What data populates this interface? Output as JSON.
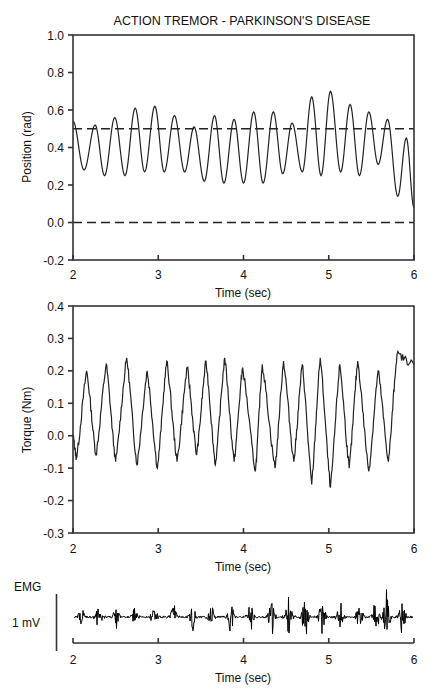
{
  "title": "ACTION TREMOR - PARKINSON'S DISEASE",
  "colors": {
    "trace": "#222222",
    "axis": "#333333",
    "background": "#ffffff"
  },
  "chart_data": [
    {
      "type": "line",
      "panel": "position",
      "title": "ACTION TREMOR - PARKINSON'S DISEASE",
      "xlabel": "Time (sec)",
      "ylabel": "Position (rad)",
      "xlim": [
        2,
        6
      ],
      "ylim": [
        -0.2,
        1.0
      ],
      "xticks": [
        "2",
        "3",
        "4",
        "5",
        "6"
      ],
      "yticks": [
        "-0.2",
        "0.0",
        "0.2",
        "0.4",
        "0.6",
        "0.8",
        "1.0"
      ],
      "grid": false,
      "reference_lines": [
        {
          "y": 0.5,
          "style": "dashed"
        },
        {
          "y": 0.0,
          "style": "dashed"
        }
      ],
      "series": [
        {
          "name": "Position",
          "extrema_t": [
            2.0,
            2.13,
            2.26,
            2.37,
            2.49,
            2.61,
            2.73,
            2.84,
            2.96,
            3.07,
            3.19,
            3.31,
            3.42,
            3.54,
            3.66,
            3.77,
            3.89,
            4.0,
            4.12,
            4.23,
            4.35,
            4.46,
            4.57,
            4.69,
            4.8,
            4.91,
            5.02,
            5.14,
            5.25,
            5.36,
            5.47,
            5.58,
            5.69,
            5.81,
            5.91,
            6.0
          ],
          "extrema_v": [
            0.54,
            0.28,
            0.52,
            0.25,
            0.56,
            0.25,
            0.61,
            0.27,
            0.62,
            0.27,
            0.57,
            0.27,
            0.51,
            0.22,
            0.57,
            0.21,
            0.55,
            0.21,
            0.59,
            0.21,
            0.59,
            0.26,
            0.53,
            0.27,
            0.67,
            0.25,
            0.7,
            0.27,
            0.63,
            0.25,
            0.59,
            0.31,
            0.55,
            0.14,
            0.45,
            0.08
          ]
        }
      ]
    },
    {
      "type": "line",
      "panel": "torque",
      "xlabel": "Time (sec)",
      "ylabel": "Torque (Nm)",
      "xlim": [
        2,
        6
      ],
      "ylim": [
        -0.3,
        0.4
      ],
      "xticks": [
        "2",
        "3",
        "4",
        "5",
        "6"
      ],
      "yticks": [
        "-0.3",
        "-0.2",
        "-0.1",
        "0.0",
        "0.1",
        "0.2",
        "0.3",
        "0.4"
      ],
      "grid": false,
      "series": [
        {
          "name": "Torque",
          "extrema_t": [
            2.0,
            2.04,
            2.16,
            2.27,
            2.39,
            2.5,
            2.63,
            2.75,
            2.87,
            2.99,
            3.1,
            3.22,
            3.34,
            3.45,
            3.56,
            3.67,
            3.78,
            3.89,
            3.99,
            4.14,
            4.22,
            4.37,
            4.47,
            4.59,
            4.69,
            4.8,
            4.9,
            5.02,
            5.13,
            5.24,
            5.34,
            5.47,
            5.58,
            5.7,
            5.8,
            6.0
          ],
          "extrema_v": [
            0.0,
            -0.07,
            0.2,
            -0.06,
            0.22,
            -0.08,
            0.24,
            -0.09,
            0.2,
            -0.1,
            0.23,
            -0.08,
            0.21,
            -0.06,
            0.23,
            -0.09,
            0.24,
            -0.08,
            0.21,
            -0.11,
            0.22,
            -0.1,
            0.23,
            -0.08,
            0.22,
            -0.15,
            0.24,
            -0.16,
            0.22,
            -0.1,
            0.23,
            -0.11,
            0.2,
            -0.08,
            0.25,
            0.22
          ]
        }
      ]
    },
    {
      "type": "line",
      "panel": "emg",
      "xlabel": "Time (sec)",
      "ylabel": "EMG",
      "scale_bar": "1 mV",
      "xlim": [
        2,
        6
      ],
      "xticks": [
        "2",
        "3",
        "4",
        "5",
        "6"
      ],
      "series": [
        {
          "name": "EMG",
          "burst_t": [
            2.1,
            2.3,
            2.51,
            2.73,
            2.95,
            3.18,
            3.4,
            3.62,
            3.85,
            4.08,
            4.33,
            4.53,
            4.72,
            4.92,
            5.13,
            5.36,
            5.55,
            5.68,
            5.86
          ],
          "burst_amp_mv": [
            0.35,
            0.35,
            0.4,
            0.35,
            0.35,
            0.55,
            0.55,
            0.45,
            0.6,
            0.45,
            0.6,
            0.7,
            0.75,
            0.55,
            0.55,
            0.55,
            0.55,
            0.95,
            0.55
          ]
        }
      ]
    }
  ],
  "labels": {
    "p1_ylabel": "Position (rad)",
    "p2_ylabel": "Torque (Nm)",
    "xlabel": "Time (sec)",
    "emg_label": "EMG",
    "emg_scale": "1 mV"
  }
}
